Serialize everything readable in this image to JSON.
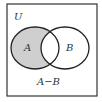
{
  "diagram": {
    "type": "venn",
    "universe_label": "U",
    "sets": [
      {
        "name": "A",
        "label": "A",
        "shaded": true
      },
      {
        "name": "B",
        "label": "B",
        "shaded": false
      }
    ],
    "shaded_region_label": "A−B",
    "colors": {
      "stroke": "#222222",
      "shade": "#cfcfcf",
      "background": "#ffffff"
    }
  }
}
